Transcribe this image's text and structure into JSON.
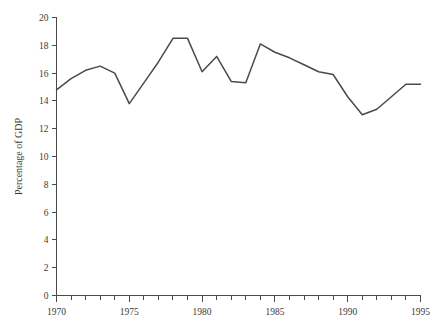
{
  "chart_data": {
    "type": "line",
    "title": "",
    "subtitle": "",
    "xlabel": "",
    "ylabel": "Percentage of GDP",
    "xlim": [
      1970,
      1995
    ],
    "ylim": [
      0,
      20
    ],
    "grid": false,
    "legend": null,
    "legend_position": "none",
    "line_color": "#4a4a4a",
    "x_tick_labels": [
      "1970",
      "1975",
      "1980",
      "1985",
      "1990",
      "1995"
    ],
    "x_major_ticks": [
      1970,
      1975,
      1980,
      1985,
      1990,
      1995
    ],
    "x_minor_ticks": [
      1971,
      1972,
      1973,
      1974,
      1976,
      1977,
      1978,
      1979,
      1981,
      1982,
      1983,
      1984,
      1986,
      1987,
      1988,
      1989,
      1991,
      1992,
      1993,
      1994
    ],
    "y_tick_labels": [
      "0",
      "2",
      "4",
      "6",
      "8",
      "10",
      "12",
      "14",
      "16",
      "18",
      "20"
    ],
    "y_ticks": [
      0,
      2,
      4,
      6,
      8,
      10,
      12,
      14,
      16,
      18,
      20
    ],
    "x": [
      1970,
      1971,
      1972,
      1973,
      1974,
      1975,
      1976,
      1977,
      1978,
      1979,
      1980,
      1981,
      1982,
      1983,
      1984,
      1985,
      1986,
      1987,
      1988,
      1989,
      1990,
      1991,
      1992,
      1993,
      1994,
      1995
    ],
    "series": [
      {
        "name": "Percentage of GDP",
        "values": [
          14.8,
          15.6,
          16.2,
          16.5,
          16.0,
          13.8,
          15.3,
          16.8,
          18.5,
          18.5,
          16.1,
          17.2,
          15.4,
          15.3,
          18.1,
          17.5,
          17.1,
          16.6,
          16.1,
          15.9,
          14.3,
          13.0,
          13.4,
          14.3,
          15.2,
          15.2
        ]
      }
    ]
  },
  "axes": {
    "y_axis_title": "Percentage of GDP"
  }
}
